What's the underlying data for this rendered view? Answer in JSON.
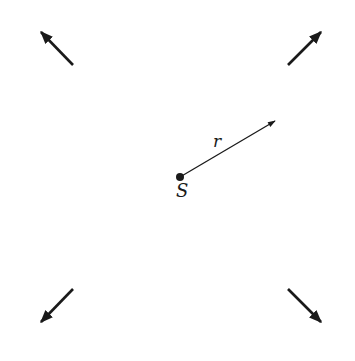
{
  "diagram": {
    "source": {
      "label": "S",
      "x": 180,
      "y": 177
    },
    "radius_vector": {
      "label": "r",
      "from": [
        180,
        177
      ],
      "to": [
        276,
        120
      ]
    },
    "outward_arrows": [
      {
        "name": "top-left",
        "from": [
          73,
          65
        ],
        "to": [
          40,
          31
        ]
      },
      {
        "name": "top-right",
        "from": [
          288,
          65
        ],
        "to": [
          322,
          31
        ]
      },
      {
        "name": "bottom-left",
        "from": [
          73,
          289
        ],
        "to": [
          40,
          323
        ]
      },
      {
        "name": "bottom-right",
        "from": [
          288,
          289
        ],
        "to": [
          322,
          323
        ]
      }
    ],
    "colors": {
      "ink": "#1a1a1a",
      "background": "#ffffff"
    }
  }
}
